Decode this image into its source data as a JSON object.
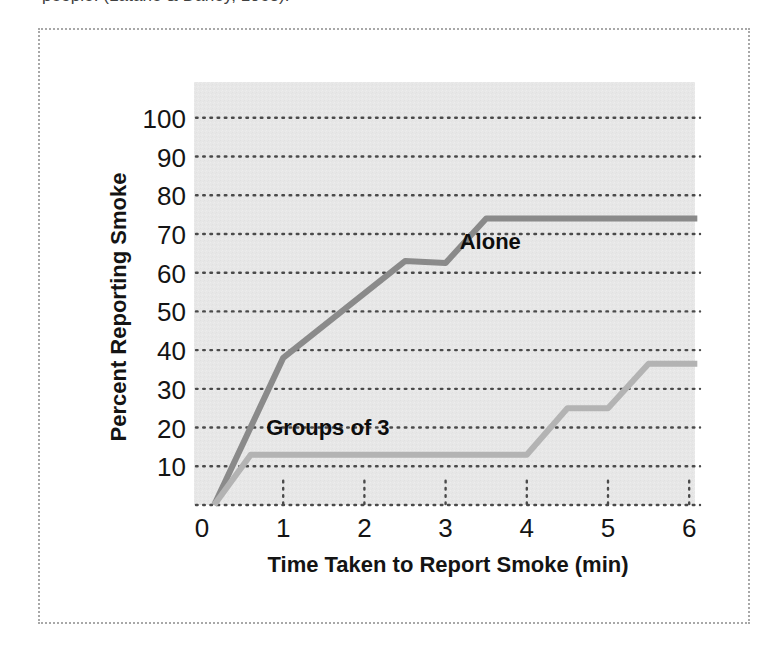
{
  "caption_fragment": "people. (Latané & Darley, 1968).",
  "frame": {
    "border_color": "#a8a8a8",
    "background": "#ffffff"
  },
  "chart_data": {
    "type": "line",
    "title": "",
    "xlabel": "Time Taken to Report Smoke (min)",
    "ylabel": "Percent Reporting Smoke",
    "xlim": [
      0,
      6.1
    ],
    "ylim": [
      0,
      105
    ],
    "xticks": [
      0,
      1,
      2,
      3,
      4,
      5,
      6
    ],
    "xticklabels": [
      "0",
      "1",
      "2",
      "3",
      "4",
      "5",
      "6"
    ],
    "yticks": [
      10,
      20,
      30,
      40,
      50,
      60,
      70,
      80,
      90,
      100
    ],
    "yticklabels": [
      "10",
      "20",
      "30",
      "40",
      "50",
      "60",
      "70",
      "80",
      "90",
      "100"
    ],
    "grid": "horizontal-dotted",
    "legend": "inline-annotations",
    "plot_background": "#e6e6e6",
    "series": [
      {
        "name": "Alone",
        "color": "#8a8a8a",
        "label_x": 3.55,
        "label_y": 66,
        "points": [
          [
            0.15,
            0
          ],
          [
            1.0,
            38
          ],
          [
            2.5,
            63
          ],
          [
            3.0,
            62.5
          ],
          [
            3.5,
            74
          ],
          [
            6.1,
            74
          ]
        ]
      },
      {
        "name": "Groups of 3",
        "color": "#b3b3b3",
        "label_x": 1.55,
        "label_y": 18,
        "points": [
          [
            0.15,
            0
          ],
          [
            0.6,
            13
          ],
          [
            4.0,
            13
          ],
          [
            4.5,
            25
          ],
          [
            5.0,
            25
          ],
          [
            5.5,
            36.5
          ],
          [
            6.1,
            36.5
          ]
        ]
      }
    ]
  }
}
